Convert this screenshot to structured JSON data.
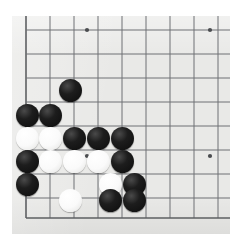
{
  "app": {
    "title": "Go board position",
    "board_game": "Go (Weiqi / Baduk)"
  },
  "board": {
    "surface_color": "#e9e9e7",
    "line_color": "#6f7174",
    "edge_line_color": "#5d5f62",
    "black_stone_color": "#111111",
    "white_stone_color": "#fafafa",
    "stone_diameter": 23,
    "grid_spacing": 24,
    "origin_x": 26,
    "origin_y": 30,
    "columns_px": [
      26,
      50,
      74,
      98,
      122,
      146,
      170,
      194,
      218
    ],
    "rows_px": [
      30,
      54,
      78,
      102,
      126,
      150,
      174,
      198,
      218
    ],
    "edges_visible": [
      "left",
      "bottom"
    ],
    "star_points": [
      {
        "x": 87,
        "y": 30
      },
      {
        "x": 210,
        "y": 30
      },
      {
        "x": 87,
        "y": 156
      },
      {
        "x": 210,
        "y": 156
      }
    ],
    "counts": {
      "black": 13,
      "white": 6,
      "total": 19
    }
  },
  "chart_data": {
    "type": "scatter",
    "xlabel": "board column (px)",
    "ylabel": "board row (px)",
    "xlim": [
      12,
      230
    ],
    "ylim": [
      16,
      234
    ],
    "grid": true,
    "legend": [
      "black",
      "white"
    ],
    "series": [
      {
        "name": "black",
        "color": "#111111",
        "points": [
          {
            "x": 70,
            "y": 90
          },
          {
            "x": 27,
            "y": 115
          },
          {
            "x": 50,
            "y": 115
          },
          {
            "x": 74,
            "y": 138
          },
          {
            "x": 98,
            "y": 138
          },
          {
            "x": 122,
            "y": 138
          },
          {
            "x": 27,
            "y": 161
          },
          {
            "x": 122,
            "y": 161
          },
          {
            "x": 27,
            "y": 184
          },
          {
            "x": 134,
            "y": 184
          },
          {
            "x": 110,
            "y": 200
          },
          {
            "x": 134,
            "y": 200
          },
          {
            "x": 27,
            "y": 138
          }
        ]
      },
      {
        "name": "white",
        "color": "#fafafa",
        "points": [
          {
            "x": 50,
            "y": 138
          },
          {
            "x": 50,
            "y": 161
          },
          {
            "x": 74,
            "y": 161
          },
          {
            "x": 98,
            "y": 161
          },
          {
            "x": 110,
            "y": 184
          },
          {
            "x": 70,
            "y": 200
          }
        ]
      }
    ]
  },
  "stones": [
    {
      "color": "black",
      "x": 70,
      "y": 90,
      "label": "black-stone"
    },
    {
      "color": "black",
      "x": 27,
      "y": 115,
      "label": "black-stone"
    },
    {
      "color": "black",
      "x": 50,
      "y": 115,
      "label": "black-stone"
    },
    {
      "color": "white",
      "x": 27,
      "y": 138,
      "label": "white-stone"
    },
    {
      "color": "white",
      "x": 50,
      "y": 138,
      "label": "white-stone"
    },
    {
      "color": "black",
      "x": 74,
      "y": 138,
      "label": "black-stone"
    },
    {
      "color": "black",
      "x": 98,
      "y": 138,
      "label": "black-stone"
    },
    {
      "color": "black",
      "x": 122,
      "y": 138,
      "label": "black-stone"
    },
    {
      "color": "black",
      "x": 27,
      "y": 161,
      "label": "black-stone"
    },
    {
      "color": "white",
      "x": 50,
      "y": 161,
      "label": "white-stone"
    },
    {
      "color": "white",
      "x": 74,
      "y": 161,
      "label": "white-stone"
    },
    {
      "color": "white",
      "x": 98,
      "y": 161,
      "label": "white-stone"
    },
    {
      "color": "black",
      "x": 122,
      "y": 161,
      "label": "black-stone"
    },
    {
      "color": "black",
      "x": 27,
      "y": 184,
      "label": "black-stone"
    },
    {
      "color": "white",
      "x": 110,
      "y": 184,
      "label": "white-stone"
    },
    {
      "color": "black",
      "x": 134,
      "y": 184,
      "label": "black-stone"
    },
    {
      "color": "white",
      "x": 70,
      "y": 200,
      "label": "white-stone"
    },
    {
      "color": "black",
      "x": 110,
      "y": 200,
      "label": "black-stone"
    },
    {
      "color": "black",
      "x": 134,
      "y": 200,
      "label": "black-stone"
    }
  ]
}
